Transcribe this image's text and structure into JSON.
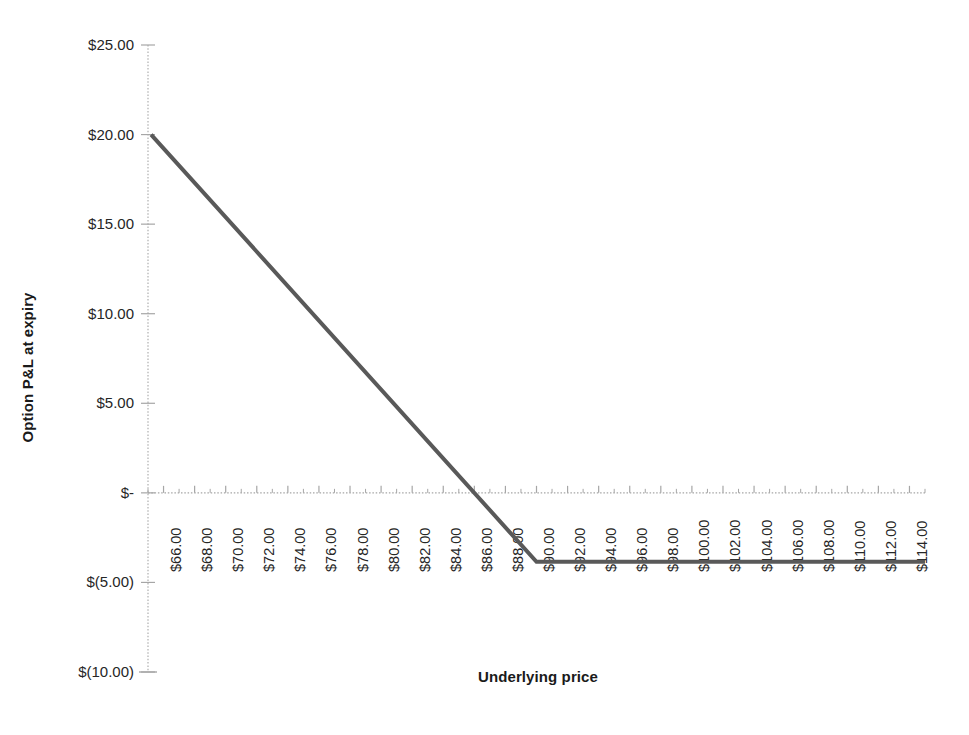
{
  "chart_data": {
    "type": "line",
    "title": "",
    "xlabel": "Underlying price",
    "ylabel": "Option P&L at expiry",
    "grid": false,
    "legend": "none",
    "xlim": [
      65,
      115
    ],
    "ylim": [
      -10,
      25
    ],
    "y_ticks": [
      25,
      20,
      15,
      10,
      5,
      0,
      -5,
      -10
    ],
    "y_tick_labels": [
      "$25.00",
      "$20.00",
      "$15.00",
      "$10.00",
      "$5.00",
      "$-",
      "$(5.00)",
      "$(10.00)"
    ],
    "x_ticks": [
      66,
      68,
      70,
      72,
      74,
      76,
      78,
      80,
      82,
      84,
      86,
      88,
      90,
      92,
      94,
      96,
      98,
      100,
      102,
      104,
      106,
      108,
      110,
      112,
      114
    ],
    "x_tick_labels": [
      "$66.00",
      "$68.00",
      "$70.00",
      "$72.00",
      "$74.00",
      "$76.00",
      "$78.00",
      "$80.00",
      "$82.00",
      "$84.00",
      "$86.00",
      "$88.00",
      "$90.00",
      "$92.00",
      "$94.00",
      "$96.00",
      "$98.00",
      "$100.00",
      "$102.00",
      "$104.00",
      "$106.00",
      "$108.00",
      "$110.00",
      "$112.00",
      "$114.00"
    ],
    "x_minor_step": 1,
    "series": [
      {
        "name": "Option P&L at expiry",
        "color": "#595959",
        "width": 4,
        "x": [
          65.2,
          90.0,
          115.0
        ],
        "values": [
          20.0,
          -3.85,
          -3.85
        ]
      }
    ],
    "annotations": {
      "breakeven_price": 86.15,
      "strike_price": 90.0,
      "max_loss": -3.85,
      "max_value_shown": 20.0
    },
    "colors": {
      "background": "#ffffff",
      "line": "#595959",
      "axis": "#bfbfbf",
      "tick": "#a6a6a6",
      "text": "#262626"
    }
  }
}
